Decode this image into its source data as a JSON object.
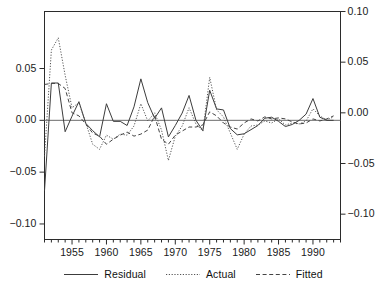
{
  "chart_data": {
    "type": "line",
    "title": "",
    "xlabel": "",
    "ylabel": "",
    "grid": false,
    "legend_position": "bottom-center",
    "xlim": [
      1951,
      1994
    ],
    "x_ticks_major": [
      1955,
      1960,
      1965,
      1970,
      1975,
      1980,
      1985,
      1990
    ],
    "x_tick_labels": [
      "1955",
      "1960",
      "1965",
      "1970",
      "1975",
      "1980",
      "1985",
      "1990"
    ],
    "x_minor_tick_step": 1,
    "axes": {
      "left": {
        "for_series": [
          "Residual"
        ],
        "ylim": [
          -0.115,
          0.105
        ],
        "ticks": [
          0.05,
          0.0,
          -0.05,
          -0.1
        ],
        "tick_labels": [
          "0.05",
          "0.00",
          "-0.05",
          "-0.10"
        ]
      },
      "right": {
        "for_series": [
          "Actual",
          "Fitted"
        ],
        "ylim": [
          -0.125,
          0.1
        ],
        "ticks": [
          0.1,
          0.05,
          0.0,
          -0.05,
          -0.1
        ],
        "tick_labels": [
          "0.10",
          "0.05",
          "0.00",
          "-0.05",
          "-0.10"
        ]
      }
    },
    "x": [
      1951,
      1952,
      1953,
      1954,
      1955,
      1956,
      1957,
      1958,
      1959,
      1960,
      1961,
      1962,
      1963,
      1964,
      1965,
      1966,
      1967,
      1968,
      1969,
      1970,
      1971,
      1972,
      1973,
      1974,
      1975,
      1976,
      1977,
      1978,
      1979,
      1980,
      1981,
      1982,
      1983,
      1984,
      1985,
      1986,
      1987,
      1988,
      1989,
      1990,
      1991,
      1992,
      1993
    ],
    "series": [
      {
        "name": "Residual",
        "style": "solid",
        "axis": "left",
        "values": [
          -0.068,
          0.036,
          0.036,
          -0.011,
          0.004,
          0.018,
          -0.003,
          -0.01,
          -0.016,
          0.016,
          -0.001,
          -0.001,
          -0.005,
          0.013,
          0.04,
          0.017,
          0.002,
          0.012,
          -0.016,
          -0.005,
          0.007,
          0.024,
          0.0,
          -0.01,
          0.029,
          0.011,
          0.01,
          -0.008,
          -0.014,
          -0.013,
          -0.009,
          -0.005,
          0.002,
          0.003,
          -0.001,
          -0.006,
          -0.004,
          0.0,
          0.006,
          0.021,
          0.003,
          0.0,
          0.0
        ]
      },
      {
        "name": "Actual",
        "style": "dotted",
        "axis": "right",
        "values": [
          -0.043,
          0.062,
          0.074,
          0.037,
          0.005,
          0.01,
          -0.01,
          -0.031,
          -0.036,
          -0.022,
          -0.026,
          -0.021,
          -0.022,
          -0.013,
          0.009,
          -0.008,
          0.0,
          -0.017,
          -0.047,
          -0.023,
          -0.013,
          0.005,
          -0.011,
          -0.018,
          0.035,
          0.003,
          -0.004,
          -0.02,
          -0.036,
          -0.021,
          -0.013,
          -0.012,
          -0.008,
          -0.01,
          -0.006,
          -0.012,
          -0.01,
          -0.011,
          -0.008,
          0.004,
          -0.003,
          -0.007,
          -0.004
        ]
      },
      {
        "name": "Fitted",
        "style": "dashed",
        "axis": "right",
        "values": [
          0.028,
          0.029,
          0.029,
          0.024,
          0.0,
          -0.003,
          -0.011,
          -0.02,
          -0.023,
          -0.031,
          -0.026,
          -0.022,
          -0.019,
          -0.023,
          -0.021,
          -0.017,
          -0.003,
          -0.026,
          -0.031,
          -0.022,
          -0.018,
          -0.014,
          -0.014,
          -0.012,
          0.001,
          -0.003,
          -0.01,
          -0.014,
          -0.016,
          -0.01,
          -0.006,
          -0.008,
          -0.004,
          -0.006,
          -0.005,
          -0.006,
          -0.009,
          -0.011,
          -0.01,
          -0.006,
          -0.008,
          -0.006,
          -0.003
        ]
      }
    ],
    "legend": [
      {
        "label": "Residual",
        "style": "solid"
      },
      {
        "label": "Actual",
        "style": "dotted"
      },
      {
        "label": "Fitted",
        "style": "dashed"
      }
    ],
    "colors": {
      "axis": "#2b2b2b",
      "residual": "#3c3c3c",
      "actual": "#555555",
      "fitted": "#444444",
      "zero_line": "#6b6b6b",
      "background": "#ffffff"
    }
  }
}
